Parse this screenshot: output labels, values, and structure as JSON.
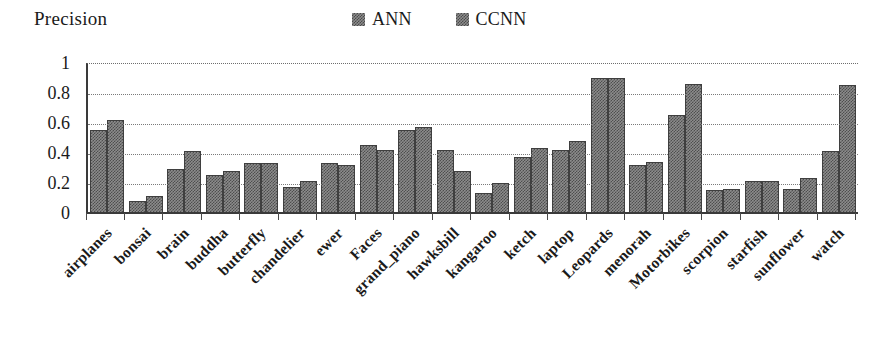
{
  "chart_data": {
    "type": "bar",
    "title": "Precision",
    "xlabel": "",
    "ylabel": "Precision",
    "ylim": [
      0,
      1
    ],
    "yticks": [
      "0",
      "0.2",
      "0.4",
      "0.6",
      "0.8",
      "1"
    ],
    "ytick_values": [
      0,
      0.2,
      0.4,
      0.6,
      0.8,
      1
    ],
    "grid": true,
    "legend_position": "top-right",
    "categories": [
      "airplanes",
      "bonsai",
      "brain",
      "buddha",
      "butterfly",
      "chandelier",
      "ewer",
      "Faces",
      "grand_piano",
      "hawksbill",
      "kangaroo",
      "ketch",
      "laptop",
      "Leopards",
      "menorah",
      "Motorbikes",
      "scorpion",
      "starfish",
      "sunflower",
      "watch"
    ],
    "series": [
      {
        "name": "ANN",
        "values": [
          0.56,
          0.09,
          0.3,
          0.26,
          0.34,
          0.18,
          0.34,
          0.46,
          0.56,
          0.43,
          0.14,
          0.38,
          0.43,
          0.91,
          0.33,
          0.66,
          0.16,
          0.22,
          0.17,
          0.42
        ]
      },
      {
        "name": "CCNN",
        "values": [
          0.63,
          0.12,
          0.42,
          0.29,
          0.34,
          0.22,
          0.33,
          0.43,
          0.58,
          0.29,
          0.21,
          0.44,
          0.49,
          0.91,
          0.35,
          0.87,
          0.17,
          0.22,
          0.24,
          0.86
        ]
      }
    ],
    "colors": {
      "series_fill": "#8c8c8c",
      "series_pattern": "#4e4e4e",
      "axis": "#3a3a3a",
      "grid": "#7a7a7a",
      "text": "#1a1a1a"
    }
  },
  "legend": {
    "entries": [
      {
        "label": "ANN",
        "swatch_icon": "checkered-square-icon"
      },
      {
        "label": "CCNN",
        "swatch_icon": "checkered-square-icon"
      }
    ]
  }
}
